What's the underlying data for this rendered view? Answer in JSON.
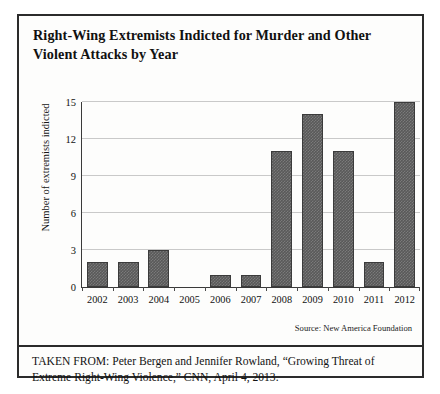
{
  "chart_data": {
    "type": "bar",
    "title": "Right-Wing Extremists Indicted for Murder and Other Violent Attacks by Year",
    "xlabel": "",
    "ylabel": "Number of extremists indicted",
    "categories": [
      "2002",
      "2003",
      "2004",
      "2005",
      "2006",
      "2007",
      "2008",
      "2009",
      "2010",
      "2011",
      "2012"
    ],
    "values": [
      2,
      2,
      3,
      0,
      1,
      1,
      11,
      14,
      11,
      2,
      15
    ],
    "ylim": [
      0,
      15
    ],
    "yticks": [
      0,
      3,
      6,
      9,
      12,
      15
    ],
    "grid": true,
    "legend": "none",
    "source": "Source: New America Foundation",
    "bar_color": "#595959",
    "bar_edge_color": "#3b3b3b",
    "grid_color": "#c9c9c9",
    "axis_color": "#3a3a3a"
  },
  "footer": {
    "attribution": "TAKEN FROM: Peter Bergen and Jennifer Rowland, “Growing Threat of Extreme Right-Wing Violence,” CNN, April 4, 2013."
  }
}
